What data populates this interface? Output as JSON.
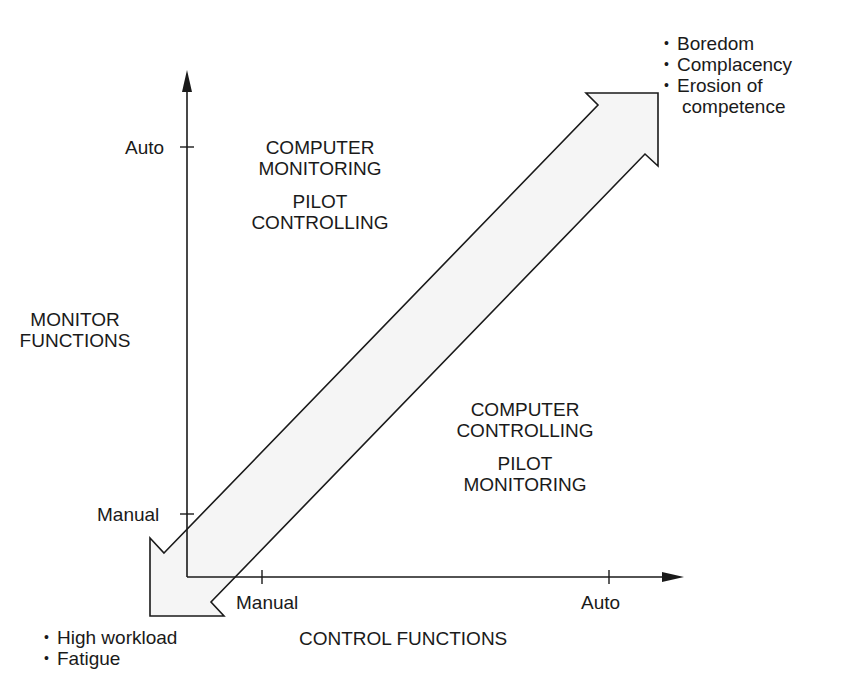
{
  "colors": {
    "line": "#1a1a1a",
    "arrow_fill": "#f5f5f5",
    "background": "#ffffff"
  },
  "axes": {
    "x_title": "CONTROL FUNCTIONS",
    "y_title_line1": "MONITOR",
    "y_title_line2": "FUNCTIONS",
    "x_ticks": [
      {
        "label": "Manual"
      },
      {
        "label": "Auto"
      }
    ],
    "y_ticks": [
      {
        "label": "Auto"
      },
      {
        "label": "Manual"
      }
    ]
  },
  "regions": {
    "upper_left": {
      "line1": "COMPUTER",
      "line2": "MONITORING",
      "line3": "PILOT",
      "line4": "CONTROLLING"
    },
    "lower_right": {
      "line1": "COMPUTER",
      "line2": "CONTROLLING",
      "line3": "PILOT",
      "line4": "MONITORING"
    }
  },
  "arrow": {
    "top_right_effects": [
      "Boredom",
      "Complacency",
      "Erosion of",
      "competence"
    ],
    "bottom_left_effects": [
      "High workload",
      "Fatigue"
    ]
  }
}
